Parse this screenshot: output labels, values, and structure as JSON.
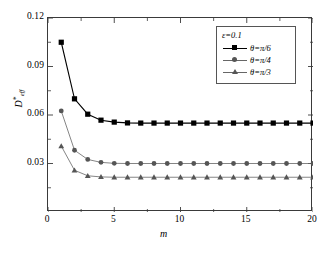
{
  "chart_data": {
    "type": "line",
    "title": "",
    "xlabel": "m",
    "ylabel": "D*eff",
    "ylabel_base": "D",
    "ylabel_sup": "*",
    "ylabel_sub": "eff",
    "xlim": [
      0,
      20
    ],
    "ylim": [
      0,
      0.12
    ],
    "xticks": [
      0,
      5,
      10,
      15,
      20
    ],
    "yticks": [
      0.03,
      0.06,
      0.09,
      0.12
    ],
    "xtick_labels": [
      "0",
      "5",
      "10",
      "15",
      "20"
    ],
    "ytick_labels": [
      "0.03",
      "0.06",
      "0.09",
      "0.12"
    ],
    "grid": false,
    "legend_position": "top-right",
    "annotation": "ε=0.1",
    "x": [
      1,
      2,
      3,
      4,
      5,
      6,
      7,
      8,
      9,
      10,
      11,
      12,
      13,
      14,
      15,
      16,
      17,
      18,
      19,
      20
    ],
    "series": [
      {
        "name": "θ=π/6",
        "marker": "square",
        "color": "#000000",
        "values": [
          0.105,
          0.07,
          0.0605,
          0.0568,
          0.0556,
          0.0551,
          0.055,
          0.055,
          0.055,
          0.055,
          0.055,
          0.055,
          0.055,
          0.055,
          0.055,
          0.055,
          0.055,
          0.055,
          0.055,
          0.055
        ]
      },
      {
        "name": "θ=π/4",
        "marker": "circle",
        "color": "#555555",
        "values": [
          0.0625,
          0.0382,
          0.0325,
          0.0307,
          0.0301,
          0.03,
          0.03,
          0.03,
          0.03,
          0.03,
          0.03,
          0.03,
          0.03,
          0.03,
          0.03,
          0.03,
          0.03,
          0.03,
          0.03,
          0.03
        ]
      },
      {
        "name": "θ=π/3",
        "marker": "triangle",
        "color": "#555555",
        "values": [
          0.0408,
          0.0258,
          0.0224,
          0.0217,
          0.0215,
          0.0215,
          0.0215,
          0.0215,
          0.0215,
          0.0215,
          0.0215,
          0.0215,
          0.0215,
          0.0215,
          0.0215,
          0.0215,
          0.0215,
          0.0215,
          0.0215,
          0.0215
        ]
      }
    ]
  },
  "legend": {
    "epsilon": "ε=0.1",
    "entries": [
      {
        "label": "θ=π/6"
      },
      {
        "label": "θ=π/4"
      },
      {
        "label": "θ=π/3"
      }
    ]
  }
}
